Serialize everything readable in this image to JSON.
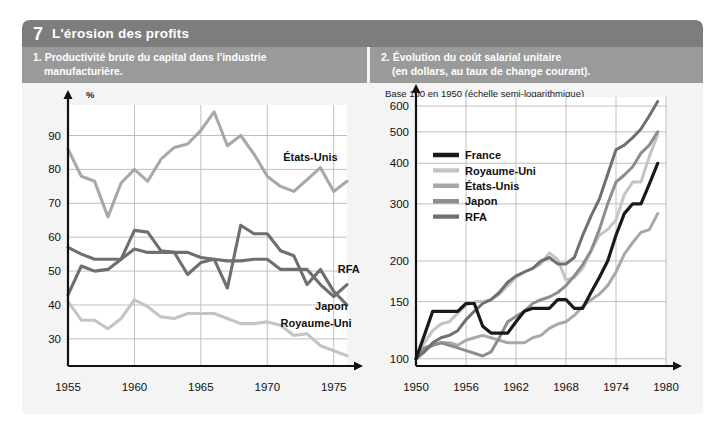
{
  "header": {
    "number": "7",
    "title": "L'érosion des profits"
  },
  "panels": [
    {
      "subtitle_line1": "1. Productivité brute du capital dans l'industrie",
      "subtitle_line2": "manufacturière."
    },
    {
      "subtitle_line1": "2. Évolution du coût salarial unitaire",
      "subtitle_line2": "(en dollars, au taux de change courant)."
    }
  ],
  "colors": {
    "title_band": "#7d7d7d",
    "subtitle_band": "#9a9a9a",
    "panel_bg": "#f4f4f4",
    "plot_bg": "#ffffff",
    "grid": "#b9b9b9",
    "axis": "#111111",
    "france": "#1a1a1a",
    "royaume_uni": "#c4c4c4",
    "etats_unis": "#a8a8a8",
    "japon": "#8d8d8d",
    "rfa": "#6f6f6f"
  },
  "chart_data": [
    {
      "id": "left",
      "type": "line",
      "title": "1. Productivité brute du capital dans l'industrie manufacturière.",
      "ylabel": "%",
      "xlabel": "",
      "scale": "linear",
      "xlim": [
        1955,
        1976
      ],
      "ylim": [
        22,
        99
      ],
      "yticks": [
        30,
        40,
        50,
        60,
        70,
        80,
        90
      ],
      "xticks": [
        1955,
        1960,
        1965,
        1970,
        1975
      ],
      "grid": true,
      "legend_position": "inline-labels",
      "annotations": [
        {
          "label": "États-Unis",
          "x": 1971.2,
          "y": 82.5
        },
        {
          "label": "RFA",
          "x": 1975.3,
          "y": 49.5
        },
        {
          "label": "Japon",
          "x": 1973.6,
          "y": 38.5
        },
        {
          "label": "Royaume-Uni",
          "x": 1971.0,
          "y": 33.5
        }
      ],
      "x": [
        1955,
        1956,
        1957,
        1958,
        1959,
        1960,
        1961,
        1962,
        1963,
        1964,
        1965,
        1966,
        1967,
        1968,
        1969,
        1970,
        1971,
        1972,
        1973,
        1974,
        1975,
        1976
      ],
      "series": [
        {
          "name": "États-Unis",
          "color": "#a8a8a8",
          "values": [
            86.0,
            78.0,
            76.5,
            66.0,
            76.0,
            80.0,
            76.5,
            83.0,
            86.5,
            87.5,
            91.5,
            97.0,
            87.0,
            90.0,
            84.5,
            78.0,
            75.0,
            73.5,
            77.0,
            80.5,
            73.5,
            76.5
          ]
        },
        {
          "name": "RFA",
          "color": "#6f6f6f",
          "values": [
            57.0,
            55.0,
            53.5,
            53.5,
            53.5,
            56.5,
            55.5,
            55.5,
            55.5,
            55.5,
            54.0,
            53.5,
            53.0,
            53.0,
            53.5,
            53.5,
            50.5,
            50.5,
            50.5,
            46.0,
            42.5,
            46.0
          ]
        },
        {
          "name": "Japon",
          "color": "#6f6f6f",
          "values": [
            43.0,
            51.5,
            50.0,
            50.5,
            53.5,
            62.0,
            61.5,
            56.0,
            55.5,
            49.0,
            52.5,
            53.5,
            45.0,
            63.5,
            61.0,
            61.0,
            56.0,
            54.5,
            46.0,
            50.5,
            44.0,
            40.0
          ]
        },
        {
          "name": "Royaume-Uni",
          "color": "#c4c4c4",
          "values": [
            41.0,
            35.5,
            35.5,
            33.0,
            36.0,
            41.5,
            39.5,
            36.5,
            36.0,
            37.5,
            37.5,
            37.5,
            36.0,
            34.5,
            34.5,
            35.0,
            34.0,
            31.0,
            31.5,
            28.0,
            26.5,
            25.0
          ]
        }
      ]
    },
    {
      "id": "right",
      "type": "line",
      "title": "2. Évolution du coût salarial unitaire (en dollars, au taux de change courant).",
      "axis_note": "Base 100 en 1950 (échelle semi-logarithmique)",
      "ylabel": "",
      "xlabel": "",
      "scale": "log",
      "xlim": [
        1950,
        1980
      ],
      "ylim": [
        95,
        640
      ],
      "yticks": [
        100,
        150,
        200,
        300,
        400,
        500,
        600
      ],
      "xticks": [
        1950,
        1956,
        1962,
        1968,
        1974,
        1980
      ],
      "grid": true,
      "legend_position": "upper-left-inside",
      "x": [
        1950,
        1951,
        1952,
        1953,
        1954,
        1955,
        1956,
        1957,
        1958,
        1959,
        1960,
        1961,
        1962,
        1963,
        1964,
        1965,
        1966,
        1967,
        1968,
        1969,
        1970,
        1971,
        1972,
        1973,
        1974,
        1975,
        1976,
        1977,
        1978,
        1979
      ],
      "series": [
        {
          "name": "France",
          "color": "#1a1a1a",
          "values": [
            100,
            118,
            140,
            140,
            140,
            140,
            148,
            148,
            126,
            120,
            120,
            120,
            130,
            140,
            143,
            143,
            143,
            152,
            152,
            143,
            143,
            160,
            178,
            200,
            240,
            280,
            300,
            300,
            345,
            400
          ]
        },
        {
          "name": "Royaume-Uni",
          "color": "#c4c4c4",
          "values": [
            100,
            112,
            122,
            128,
            130,
            138,
            146,
            150,
            150,
            152,
            158,
            168,
            178,
            185,
            190,
            196,
            212,
            202,
            175,
            178,
            190,
            215,
            240,
            250,
            268,
            320,
            350,
            350,
            420,
            490
          ]
        },
        {
          "name": "États-Unis",
          "color": "#a8a8a8",
          "values": [
            100,
            106,
            110,
            112,
            112,
            110,
            114,
            116,
            118,
            116,
            114,
            112,
            112,
            112,
            116,
            118,
            124,
            128,
            130,
            136,
            145,
            152,
            158,
            168,
            185,
            210,
            228,
            245,
            250,
            280
          ]
        },
        {
          "name": "Japon",
          "color": "#8d8d8d",
          "values": [
            100,
            108,
            110,
            112,
            110,
            108,
            106,
            104,
            102,
            105,
            116,
            130,
            135,
            140,
            148,
            152,
            155,
            160,
            168,
            180,
            195,
            215,
            250,
            300,
            350,
            368,
            390,
            430,
            455,
            500
          ]
        },
        {
          "name": "RFA",
          "color": "#6f6f6f",
          "values": [
            100,
            105,
            112,
            116,
            118,
            122,
            132,
            140,
            148,
            152,
            160,
            172,
            180,
            185,
            190,
            200,
            205,
            196,
            196,
            205,
            240,
            275,
            310,
            370,
            440,
            455,
            480,
            510,
            560,
            620
          ]
        }
      ],
      "legend": [
        {
          "label": "France",
          "color": "#1a1a1a"
        },
        {
          "label": "Royaume-Uni",
          "color": "#c4c4c4"
        },
        {
          "label": "États-Unis",
          "color": "#a8a8a8"
        },
        {
          "label": "Japon",
          "color": "#8d8d8d"
        },
        {
          "label": "RFA",
          "color": "#6f6f6f"
        }
      ]
    }
  ]
}
